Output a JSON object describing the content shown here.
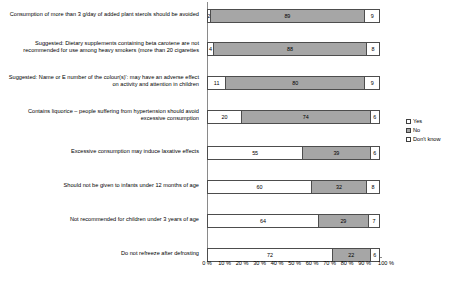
{
  "chart_data": {
    "type": "bar",
    "orientation": "horizontal",
    "stacked": true,
    "title": "",
    "xlabel": "",
    "ylabel": "",
    "xlim": [
      0,
      100
    ],
    "grid": false,
    "legend_position": "right",
    "categories": [
      "Consumption of more than 3 g/day of added plant sterols should be avoided",
      "Suggested: Dietary supplements containing beta carotene are not recommended for use among heavy smokers (more than 20 cigarettes",
      "Suggested: Name or E number of the colour(s)': may have an adverse effect on activity and attention in children",
      "Contains liquorice – people suffering from hypertension should avoid excessive consumption",
      "Excessive consumption may induce laxative effects",
      "Should not be given to infants under 12 months of age",
      "Not recommended for children under 3 years of age",
      "Do not refreeze after defrosting"
    ],
    "series": [
      {
        "name": "Yes",
        "color": "#ffffff",
        "values": [
          2,
          4,
          11,
          20,
          55,
          60,
          64,
          72
        ]
      },
      {
        "name": "No",
        "color": "#a6a6a6",
        "values": [
          89,
          88,
          80,
          74,
          39,
          32,
          29,
          22
        ]
      },
      {
        "name": "Don't know",
        "color": "#ffffff",
        "values": [
          9,
          8,
          9,
          6,
          6,
          8,
          7,
          6
        ]
      }
    ],
    "xticks": [
      "0 %",
      "10 %",
      "20 %",
      "30 %",
      "40 %",
      "50 %",
      "60 %",
      "70 %",
      "80 %",
      "90 %",
      "100 %"
    ],
    "xtick_values": [
      0,
      10,
      20,
      30,
      40,
      50,
      60,
      70,
      80,
      90,
      100
    ]
  },
  "legend": {
    "items": [
      {
        "label": "Yes"
      },
      {
        "label": "No"
      },
      {
        "label": "Don't know"
      }
    ]
  }
}
